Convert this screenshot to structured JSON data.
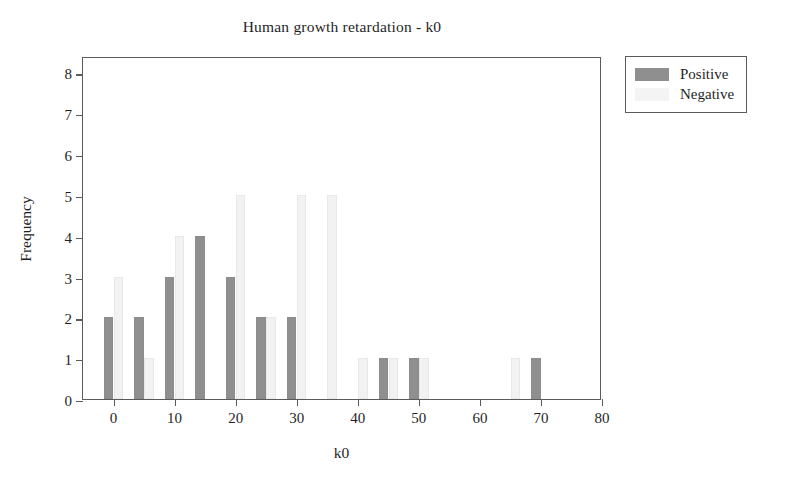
{
  "chart_data": {
    "type": "bar",
    "title": "Human growth retardation - k0",
    "xlabel": "k0",
    "ylabel": "Frequency",
    "xlim": [
      -5,
      80
    ],
    "ylim": [
      0,
      8.4
    ],
    "xticks": [
      0,
      10,
      20,
      30,
      40,
      50,
      60,
      70,
      80
    ],
    "yticks": [
      0,
      1,
      2,
      3,
      4,
      5,
      6,
      7,
      8
    ],
    "grid": false,
    "legend_position": "outside-top-right",
    "categories": [
      0,
      5,
      10,
      15,
      20,
      25,
      30,
      35,
      40,
      45,
      50,
      55,
      60,
      65,
      70
    ],
    "series": [
      {
        "name": "Positive",
        "color": "#8f8f8f",
        "values": [
          2,
          2,
          3,
          4,
          3,
          2,
          2,
          0,
          0,
          1,
          1,
          0,
          0,
          0,
          1
        ]
      },
      {
        "name": "Negative",
        "color": "#f2f2f2",
        "values": [
          3,
          1,
          4,
          0,
          5,
          2,
          5,
          5,
          1,
          1,
          1,
          0,
          0,
          1,
          0
        ]
      }
    ]
  },
  "legend": {
    "entries": [
      {
        "label": "Positive",
        "swatch": "positive"
      },
      {
        "label": "Negative",
        "swatch": "negative"
      }
    ]
  }
}
